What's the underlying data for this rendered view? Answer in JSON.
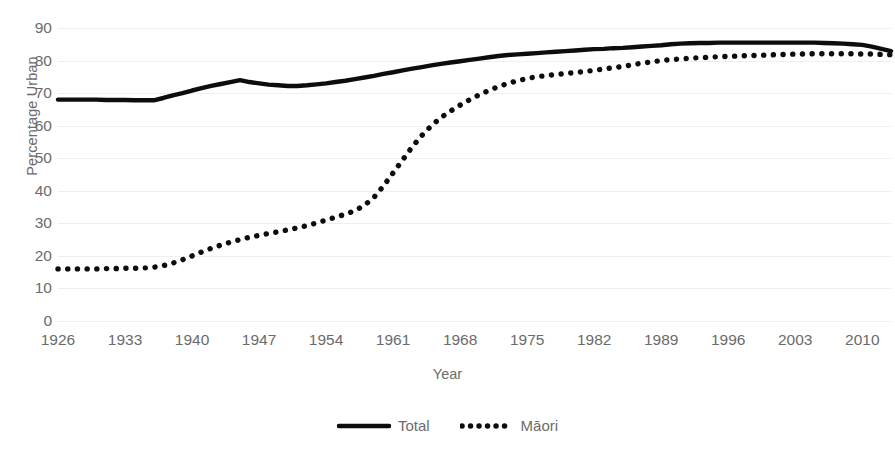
{
  "chart_data": {
    "type": "line",
    "title": "",
    "subtitle": "",
    "xlabel": "Year",
    "ylabel": "Percentage Urban",
    "xlim": [
      1926,
      2013
    ],
    "ylim": [
      0,
      90
    ],
    "grid": true,
    "legend_position": "bottom",
    "xticks": [
      "1926",
      "1933",
      "1940",
      "1947",
      "1954",
      "1961",
      "1968",
      "1975",
      "1982",
      "1989",
      "1996",
      "2003",
      "2010"
    ],
    "xtick_values": [
      1926,
      1933,
      1940,
      1947,
      1954,
      1961,
      1968,
      1975,
      1982,
      1989,
      1996,
      2003,
      2010
    ],
    "yticks": [
      "0",
      "10",
      "20",
      "30",
      "40",
      "50",
      "60",
      "70",
      "80",
      "90"
    ],
    "ytick_values": [
      0,
      10,
      20,
      30,
      40,
      50,
      60,
      70,
      80,
      90
    ],
    "x": [
      1926,
      1927,
      1928,
      1929,
      1930,
      1931,
      1932,
      1933,
      1934,
      1935,
      1936,
      1937,
      1938,
      1939,
      1940,
      1941,
      1942,
      1943,
      1944,
      1945,
      1946,
      1947,
      1948,
      1949,
      1950,
      1951,
      1952,
      1953,
      1954,
      1955,
      1956,
      1957,
      1958,
      1959,
      1960,
      1961,
      1962,
      1963,
      1964,
      1965,
      1966,
      1967,
      1968,
      1969,
      1970,
      1971,
      1972,
      1973,
      1974,
      1975,
      1976,
      1977,
      1978,
      1979,
      1980,
      1981,
      1982,
      1983,
      1984,
      1985,
      1986,
      1987,
      1988,
      1989,
      1990,
      1991,
      1992,
      1993,
      1994,
      1995,
      1996,
      1997,
      1998,
      1999,
      2000,
      2001,
      2002,
      2003,
      2004,
      2005,
      2006,
      2007,
      2008,
      2009,
      2010,
      2011,
      2012,
      2013
    ],
    "series": [
      {
        "name": "Total",
        "style": "solid",
        "color": "#0d0d0d",
        "values": [
          68.0,
          68.0,
          68.0,
          68.0,
          68.0,
          67.9,
          67.9,
          67.9,
          67.8,
          67.8,
          67.8,
          68.5,
          69.3,
          70.0,
          70.8,
          71.5,
          72.2,
          72.8,
          73.4,
          74.0,
          73.4,
          73.0,
          72.6,
          72.4,
          72.2,
          72.2,
          72.4,
          72.7,
          73.0,
          73.4,
          73.8,
          74.3,
          74.8,
          75.3,
          75.9,
          76.4,
          77.0,
          77.5,
          78.0,
          78.5,
          79.0,
          79.4,
          79.8,
          80.2,
          80.6,
          81.0,
          81.4,
          81.7,
          81.9,
          82.1,
          82.3,
          82.5,
          82.7,
          82.9,
          83.1,
          83.3,
          83.5,
          83.6,
          83.8,
          83.9,
          84.1,
          84.3,
          84.5,
          84.7,
          85.0,
          85.2,
          85.3,
          85.4,
          85.4,
          85.5,
          85.5,
          85.5,
          85.5,
          85.5,
          85.5,
          85.5,
          85.5,
          85.5,
          85.5,
          85.5,
          85.4,
          85.3,
          85.2,
          85.0,
          84.8,
          84.3,
          83.6,
          82.9
        ]
      },
      {
        "name": "Māori",
        "style": "dotted",
        "color": "#0d0d0d",
        "values": [
          16.0,
          16.0,
          16.0,
          16.0,
          16.0,
          16.1,
          16.1,
          16.2,
          16.2,
          16.3,
          16.5,
          17.0,
          17.8,
          18.8,
          20.0,
          21.2,
          22.3,
          23.3,
          24.2,
          25.0,
          25.7,
          26.3,
          26.9,
          27.4,
          28.0,
          28.6,
          29.3,
          30.1,
          31.0,
          31.9,
          32.8,
          33.9,
          35.5,
          38.0,
          41.5,
          45.5,
          49.5,
          53.5,
          57.0,
          60.0,
          62.5,
          64.5,
          66.3,
          68.0,
          69.5,
          70.8,
          72.0,
          73.0,
          73.8,
          74.5,
          75.0,
          75.4,
          75.7,
          76.0,
          76.3,
          76.6,
          77.0,
          77.4,
          77.8,
          78.2,
          78.7,
          79.2,
          79.6,
          80.0,
          80.3,
          80.5,
          80.7,
          80.9,
          81.0,
          81.2,
          81.3,
          81.4,
          81.5,
          81.6,
          81.7,
          81.8,
          81.9,
          82.0,
          82.0,
          82.1,
          82.1,
          82.1,
          82.1,
          82.1,
          82.0,
          82.0,
          81.9,
          81.8
        ]
      }
    ]
  },
  "legend": {
    "entries": [
      {
        "label": "Total",
        "style": "solid"
      },
      {
        "label": "Māori",
        "style": "dotted"
      }
    ]
  }
}
